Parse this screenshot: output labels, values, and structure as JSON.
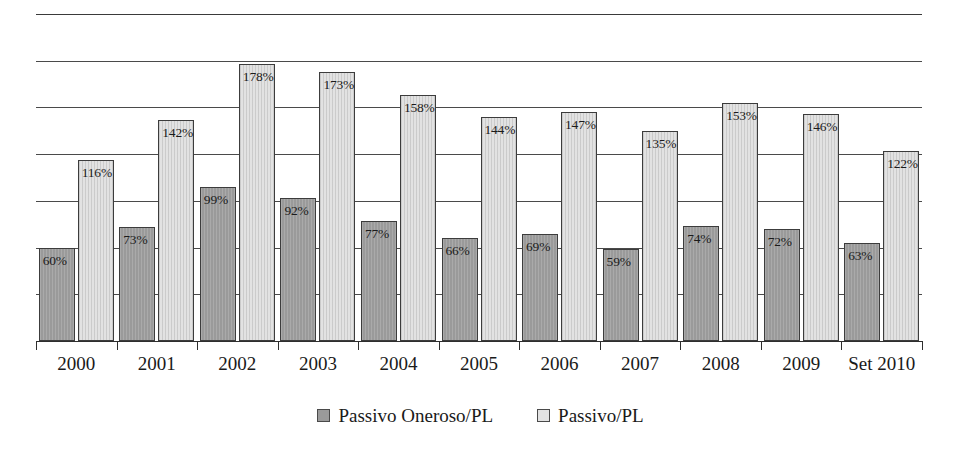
{
  "chart_data": {
    "type": "bar",
    "title": "",
    "subtitle": "",
    "xlabel": "",
    "ylabel": "",
    "ylim": [
      0,
      210
    ],
    "grid": true,
    "grid_values": [
      30,
      60,
      90,
      120,
      150,
      180,
      210
    ],
    "legend_position": "bottom-center",
    "categories": [
      "2000",
      "2001",
      "2002",
      "2003",
      "2004",
      "2005",
      "2006",
      "2007",
      "2008",
      "2009",
      "Set 2010"
    ],
    "series": [
      {
        "name": "Passivo Oneroso/PL",
        "color": "#9a9a9a",
        "values": [
          60,
          73,
          99,
          92,
          77,
          66,
          69,
          59,
          74,
          72,
          63
        ],
        "labels": [
          "60%",
          "73%",
          "99%",
          "92%",
          "77%",
          "66%",
          "69%",
          "59%",
          "74%",
          "72%",
          "63%"
        ]
      },
      {
        "name": "Passivo/PL",
        "color": "#e2e2e2",
        "values": [
          116,
          142,
          178,
          173,
          158,
          144,
          147,
          135,
          153,
          146,
          122
        ],
        "labels": [
          "116%",
          "142%",
          "178%",
          "173%",
          "158%",
          "144%",
          "147%",
          "135%",
          "153%",
          "146%",
          "122%"
        ]
      }
    ]
  },
  "legend": {
    "items": [
      {
        "label": "Passivo Oneroso/PL",
        "swatch": "dark"
      },
      {
        "label": "Passivo/PL",
        "swatch": "light"
      }
    ]
  }
}
